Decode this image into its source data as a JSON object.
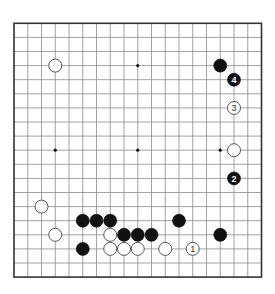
{
  "diagram": {
    "type": "go-board",
    "board_size": 19,
    "grid": {
      "left": 14,
      "top": 23.3,
      "dx": 13.75,
      "dy": 14.1
    },
    "stone_radius": 6.5,
    "star_points": [
      [
        3,
        3
      ],
      [
        9,
        3
      ],
      [
        15,
        3
      ],
      [
        3,
        9
      ],
      [
        9,
        9
      ],
      [
        15,
        9
      ],
      [
        3,
        15
      ],
      [
        9,
        15
      ],
      [
        15,
        15
      ]
    ],
    "stones": [
      {
        "color": "white",
        "col": 3,
        "row": 3,
        "label": ""
      },
      {
        "color": "black",
        "col": 15,
        "row": 3,
        "label": ""
      },
      {
        "color": "black",
        "col": 16,
        "row": 4,
        "label": "4"
      },
      {
        "color": "white",
        "col": 16,
        "row": 6,
        "label": "3"
      },
      {
        "color": "white",
        "col": 16,
        "row": 9,
        "label": ""
      },
      {
        "color": "black",
        "col": 16,
        "row": 11,
        "label": "2"
      },
      {
        "color": "white",
        "col": 2,
        "row": 13,
        "label": ""
      },
      {
        "color": "black",
        "col": 5,
        "row": 14,
        "label": ""
      },
      {
        "color": "black",
        "col": 6,
        "row": 14,
        "label": ""
      },
      {
        "color": "black",
        "col": 7,
        "row": 14,
        "label": ""
      },
      {
        "color": "black",
        "col": 12,
        "row": 14,
        "label": ""
      },
      {
        "color": "white",
        "col": 3,
        "row": 15,
        "label": ""
      },
      {
        "color": "white",
        "col": 7,
        "row": 15,
        "label": ""
      },
      {
        "color": "black",
        "col": 8,
        "row": 15,
        "label": ""
      },
      {
        "color": "black",
        "col": 9,
        "row": 15,
        "label": ""
      },
      {
        "color": "black",
        "col": 10,
        "row": 15,
        "label": ""
      },
      {
        "color": "black",
        "col": 15,
        "row": 15,
        "label": ""
      },
      {
        "color": "black",
        "col": 5,
        "row": 16,
        "label": ""
      },
      {
        "color": "white",
        "col": 7,
        "row": 16,
        "label": ""
      },
      {
        "color": "white",
        "col": 8,
        "row": 16,
        "label": ""
      },
      {
        "color": "white",
        "col": 9,
        "row": 16,
        "label": ""
      },
      {
        "color": "white",
        "col": 11,
        "row": 16,
        "label": ""
      },
      {
        "color": "white",
        "col": 13,
        "row": 16,
        "label": "1"
      }
    ],
    "colors": {
      "black_stone": "#111111",
      "white_stone": "#ffffff",
      "grid": "#8a8a8a",
      "edge": "#333333"
    }
  }
}
